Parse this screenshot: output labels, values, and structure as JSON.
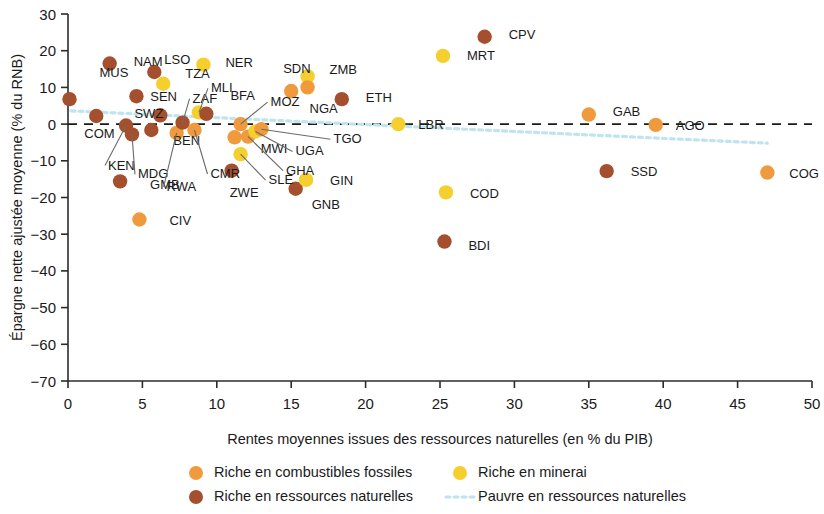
{
  "chart_data": {
    "type": "scatter",
    "title": "",
    "xlabel": "Rentes moyennes issues des ressources naturelles (en % du PIB)",
    "ylabel": "Épargne nette ajustée moyenne (% du RNB)",
    "xlim": [
      0,
      50
    ],
    "ylim": [
      -70,
      30
    ],
    "xticks": [
      0,
      5,
      10,
      15,
      20,
      25,
      30,
      35,
      40,
      45,
      50
    ],
    "yticks": [
      30,
      20,
      10,
      0,
      -10,
      -20,
      -30,
      -40,
      -50,
      -60,
      -70
    ],
    "xtick_labels": [
      "0",
      "5",
      "10",
      "15",
      "20",
      "25",
      "30",
      "35",
      "40",
      "45",
      "50"
    ],
    "ytick_labels": [
      "30",
      "20",
      "10",
      "0",
      "−10",
      "−20",
      "−30",
      "−40",
      "−50",
      "−60",
      "−70"
    ],
    "grid": false,
    "zero_reference_line": {
      "y": 0,
      "style": "dashed",
      "color": "#1a1a1a"
    },
    "trend_line": {
      "name": "Pauvre en ressources naturelles",
      "style": "dotted",
      "color": "#bfe4ef",
      "x": [
        0.2,
        47.0
      ],
      "y": [
        3.6,
        -5.2
      ]
    },
    "colors": {
      "fossil_fuels": "#ef9a3d",
      "minerals": "#f5cf2e",
      "natural_resources": "#a4502f"
    },
    "legend": {
      "position": "bottom",
      "entries": [
        {
          "label": "Riche en combustibles fossiles",
          "marker": "circle",
          "color": "#ef9a3d"
        },
        {
          "label": "Riche en minerai",
          "marker": "circle",
          "color": "#f5cf2e"
        },
        {
          "label": "Riche en ressources naturelles",
          "marker": "circle",
          "color": "#a4502f"
        },
        {
          "label": "Pauvre en ressources naturelles",
          "marker": "dotted-line",
          "color": "#bfe4ef"
        }
      ]
    },
    "points": [
      {
        "code": "MUS",
        "x": 0.1,
        "y": 6.8,
        "group": "natural_resources",
        "lx": 30,
        "ly": -22,
        "leader": false
      },
      {
        "code": "COM",
        "x": 1.9,
        "y": 2.2,
        "group": "natural_resources",
        "lx": -12,
        "ly": 22,
        "leader": false
      },
      {
        "code": "NAM",
        "x": 2.8,
        "y": 16.5,
        "group": "natural_resources",
        "lx": 24,
        "ly": 2,
        "leader": false
      },
      {
        "code": "KEN",
        "x": 3.9,
        "y": -0.4,
        "group": "natural_resources",
        "lx": -18,
        "ly": 44,
        "leader": true
      },
      {
        "code": "GMB",
        "x": 3.5,
        "y": -15.6,
        "group": "natural_resources",
        "lx": 30,
        "ly": 8,
        "leader": false
      },
      {
        "code": "MDG",
        "x": 4.3,
        "y": -2.8,
        "group": "natural_resources",
        "lx": 6,
        "ly": 44,
        "leader": true
      },
      {
        "code": "SWZ",
        "x": 4.6,
        "y": 7.6,
        "group": "natural_resources",
        "lx": -2,
        "ly": 22,
        "leader": false
      },
      {
        "code": "CIV",
        "x": 4.8,
        "y": -26.0,
        "group": "fossil_fuels",
        "lx": 30,
        "ly": 5,
        "leader": false
      },
      {
        "code": "BEN",
        "x": 5.6,
        "y": -1.6,
        "group": "natural_resources",
        "lx": 22,
        "ly": 15,
        "leader": false
      },
      {
        "code": "LSO",
        "x": 5.8,
        "y": 14.2,
        "group": "natural_resources",
        "lx": 10,
        "ly": -8,
        "leader": false
      },
      {
        "code": "SEN",
        "x": 6.2,
        "y": 2.4,
        "group": "natural_resources",
        "lx": -10,
        "ly": -14,
        "leader": false
      },
      {
        "code": "TZA",
        "x": 6.4,
        "y": 11.0,
        "group": "minerals",
        "lx": 22,
        "ly": -6,
        "leader": false
      },
      {
        "code": "RWA",
        "x": 7.3,
        "y": -2.4,
        "group": "fossil_fuels",
        "lx": -10,
        "ly": 58,
        "leader": true
      },
      {
        "code": "ZAF",
        "x": 7.7,
        "y": 0.4,
        "group": "natural_resources",
        "lx": 10,
        "ly": -20,
        "leader": true
      },
      {
        "code": "CMR",
        "x": 8.5,
        "y": -1.6,
        "group": "fossil_fuels",
        "lx": 16,
        "ly": 48,
        "leader": true
      },
      {
        "code": "MLI",
        "x": 8.8,
        "y": 3.2,
        "group": "minerals",
        "lx": 12,
        "ly": -20,
        "leader": true
      },
      {
        "code": "BFA",
        "x": 9.3,
        "y": 2.8,
        "group": "natural_resources",
        "lx": 24,
        "ly": -14,
        "leader": false
      },
      {
        "code": "NER",
        "x": 9.1,
        "y": 16.2,
        "group": "minerals",
        "lx": 22,
        "ly": 2,
        "leader": false
      },
      {
        "code": "ZWE",
        "x": 11.0,
        "y": -12.7,
        "group": "natural_resources",
        "lx": -2,
        "ly": 26,
        "leader": false
      },
      {
        "code": "MWI",
        "x": 11.2,
        "y": -3.6,
        "group": "fossil_fuels",
        "lx": 26,
        "ly": 16,
        "leader": false
      },
      {
        "code": "SLE",
        "x": 11.6,
        "y": -8.2,
        "group": "minerals",
        "lx": 28,
        "ly": 30,
        "leader": true
      },
      {
        "code": "MOZ",
        "x": 11.6,
        "y": 0.0,
        "group": "fossil_fuels",
        "lx": 30,
        "ly": -18,
        "leader": true
      },
      {
        "code": "GHA",
        "x": 12.1,
        "y": -3.4,
        "group": "fossil_fuels",
        "lx": 38,
        "ly": 38,
        "leader": true
      },
      {
        "code": "UGA",
        "x": 12.6,
        "y": -2.0,
        "group": "minerals",
        "lx": 40,
        "ly": 24,
        "leader": true
      },
      {
        "code": "TGO",
        "x": 13.0,
        "y": -1.4,
        "group": "fossil_fuels",
        "lx": 72,
        "ly": 14,
        "leader": true
      },
      {
        "code": "SDN",
        "x": 15.0,
        "y": 9.0,
        "group": "fossil_fuels",
        "lx": -8,
        "ly": -18,
        "leader": false
      },
      {
        "code": "GNB",
        "x": 15.3,
        "y": -17.6,
        "group": "natural_resources",
        "lx": 16,
        "ly": 20,
        "leader": false
      },
      {
        "code": "GIN",
        "x": 16.0,
        "y": -15.2,
        "group": "minerals",
        "lx": 24,
        "ly": 5,
        "leader": false
      },
      {
        "code": "ZMB",
        "x": 16.1,
        "y": 13.0,
        "group": "minerals",
        "lx": 22,
        "ly": -2,
        "leader": false
      },
      {
        "code": "NGA",
        "x": 16.1,
        "y": 10.0,
        "group": "fossil_fuels",
        "lx": 2,
        "ly": 26,
        "leader": false
      },
      {
        "code": "ETH",
        "x": 18.4,
        "y": 6.8,
        "group": "natural_resources",
        "lx": 24,
        "ly": 3,
        "leader": false
      },
      {
        "code": "LBR",
        "x": 22.2,
        "y": 0.0,
        "group": "minerals",
        "lx": 20,
        "ly": 5,
        "leader": false
      },
      {
        "code": "COD",
        "x": 25.4,
        "y": -18.6,
        "group": "minerals",
        "lx": 24,
        "ly": 6,
        "leader": false
      },
      {
        "code": "MRT",
        "x": 25.2,
        "y": 18.6,
        "group": "minerals",
        "lx": 24,
        "ly": 4,
        "leader": false
      },
      {
        "code": "BDI",
        "x": 25.3,
        "y": -32.0,
        "group": "natural_resources",
        "lx": 24,
        "ly": 8,
        "leader": false
      },
      {
        "code": "CPV",
        "x": 28.0,
        "y": 23.8,
        "group": "natural_resources",
        "lx": 24,
        "ly": 2,
        "leader": false
      },
      {
        "code": "GAB",
        "x": 35.0,
        "y": 2.6,
        "group": "fossil_fuels",
        "lx": 24,
        "ly": 1,
        "leader": false
      },
      {
        "code": "SSD",
        "x": 36.2,
        "y": -12.8,
        "group": "natural_resources",
        "lx": 24,
        "ly": 5,
        "leader": false
      },
      {
        "code": "AGO",
        "x": 39.5,
        "y": -0.2,
        "group": "fossil_fuels",
        "lx": 20,
        "ly": 5,
        "leader": false
      },
      {
        "code": "COG",
        "x": 47.0,
        "y": -13.2,
        "group": "fossil_fuels",
        "lx": 22,
        "ly": 5,
        "leader": false
      }
    ]
  }
}
